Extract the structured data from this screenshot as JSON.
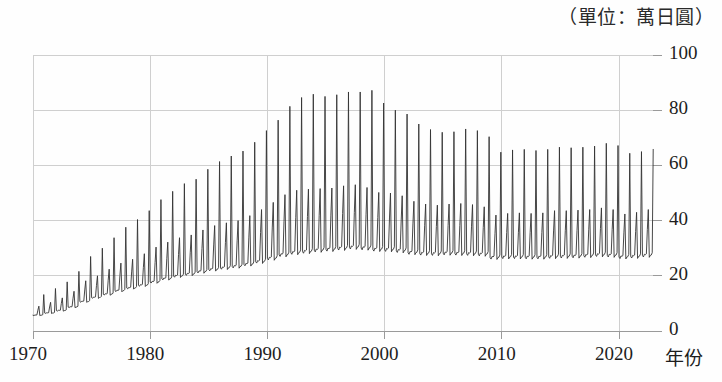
{
  "chart_data": {
    "type": "line",
    "title": "（單位：萬日圓）",
    "xlabel": "年份",
    "ylabel": "",
    "unit_caption": "（單位：萬日圓）",
    "xlim": [
      1970,
      2022.9
    ],
    "ylim": [
      0,
      100
    ],
    "grid": true,
    "legend": null,
    "xticks": [
      1970,
      1980,
      1990,
      2000,
      2010,
      2020
    ],
    "xtick_labels": [
      "1970",
      "1980",
      "1990",
      "2000",
      "2010",
      "2020"
    ],
    "yticks": [
      0,
      20,
      40,
      60,
      80,
      100
    ],
    "ytick_labels": [
      "0",
      "20",
      "40",
      "60",
      "80",
      "100"
    ],
    "y_axis_side": "right",
    "line_color": "#333333",
    "grid_color": "#cfcfcf",
    "axis_color": "#9a9a9a",
    "series_name": "每月現金給與總額",
    "frequency": "monthly",
    "annual_profile": [
      {
        "year": 1970,
        "base": 5.8,
        "summer": 9.0,
        "winter": 13.2
      },
      {
        "year": 1971,
        "base": 6.6,
        "summer": 10.4,
        "winter": 15.4
      },
      {
        "year": 1972,
        "base": 7.5,
        "summer": 12.0,
        "winter": 17.8
      },
      {
        "year": 1973,
        "base": 8.8,
        "summer": 14.4,
        "winter": 21.6
      },
      {
        "year": 1974,
        "base": 10.8,
        "summer": 18.2,
        "winter": 27.0
      },
      {
        "year": 1975,
        "base": 12.3,
        "summer": 20.0,
        "winter": 30.0
      },
      {
        "year": 1976,
        "base": 13.5,
        "summer": 22.4,
        "winter": 33.8
      },
      {
        "year": 1977,
        "base": 14.8,
        "summer": 24.6,
        "winter": 37.6
      },
      {
        "year": 1978,
        "base": 15.8,
        "summer": 26.0,
        "winter": 40.4
      },
      {
        "year": 1979,
        "base": 16.8,
        "summer": 28.0,
        "winter": 43.6
      },
      {
        "year": 1980,
        "base": 18.0,
        "summer": 30.4,
        "winter": 47.6
      },
      {
        "year": 1981,
        "base": 19.2,
        "summer": 32.2,
        "winter": 50.6
      },
      {
        "year": 1982,
        "base": 20.2,
        "summer": 33.8,
        "winter": 53.4
      },
      {
        "year": 1983,
        "base": 20.9,
        "summer": 34.8,
        "winter": 55.0
      },
      {
        "year": 1984,
        "base": 21.8,
        "summer": 36.6,
        "winter": 58.6
      },
      {
        "year": 1985,
        "base": 22.6,
        "summer": 38.2,
        "winter": 61.4
      },
      {
        "year": 1986,
        "base": 23.2,
        "summer": 39.2,
        "winter": 63.4
      },
      {
        "year": 1987,
        "base": 23.7,
        "summer": 40.0,
        "winter": 65.2
      },
      {
        "year": 1988,
        "base": 24.5,
        "summer": 41.8,
        "winter": 68.4
      },
      {
        "year": 1989,
        "base": 25.5,
        "summer": 44.0,
        "winter": 72.6
      },
      {
        "year": 1990,
        "base": 26.7,
        "summer": 46.6,
        "winter": 76.4
      },
      {
        "year": 1991,
        "base": 28.0,
        "summer": 49.4,
        "winter": 81.4
      },
      {
        "year": 1992,
        "base": 28.8,
        "summer": 51.0,
        "winter": 84.6
      },
      {
        "year": 1993,
        "base": 29.2,
        "summer": 51.4,
        "winter": 85.8
      },
      {
        "year": 1994,
        "base": 29.7,
        "summer": 51.6,
        "winter": 85.0
      },
      {
        "year": 1995,
        "base": 30.0,
        "summer": 51.8,
        "winter": 85.6
      },
      {
        "year": 1996,
        "base": 30.4,
        "summer": 52.6,
        "winter": 86.6
      },
      {
        "year": 1997,
        "base": 30.8,
        "summer": 53.0,
        "winter": 86.6
      },
      {
        "year": 1998,
        "base": 30.5,
        "summer": 52.0,
        "winter": 87.2
      },
      {
        "year": 1999,
        "base": 30.0,
        "summer": 50.2,
        "winter": 82.6
      },
      {
        "year": 2000,
        "base": 29.9,
        "summer": 50.0,
        "winter": 80.0
      },
      {
        "year": 2001,
        "base": 29.5,
        "summer": 49.0,
        "winter": 78.6
      },
      {
        "year": 2002,
        "base": 28.8,
        "summer": 47.0,
        "winter": 75.0
      },
      {
        "year": 2003,
        "base": 28.5,
        "summer": 46.0,
        "winter": 73.0
      },
      {
        "year": 2004,
        "base": 28.4,
        "summer": 45.6,
        "winter": 72.0
      },
      {
        "year": 2005,
        "base": 28.6,
        "summer": 46.0,
        "winter": 72.2
      },
      {
        "year": 2006,
        "base": 28.5,
        "summer": 46.2,
        "winter": 73.2
      },
      {
        "year": 2007,
        "base": 28.4,
        "summer": 45.8,
        "winter": 72.6
      },
      {
        "year": 2008,
        "base": 28.2,
        "summer": 45.0,
        "winter": 70.4
      },
      {
        "year": 2009,
        "base": 27.0,
        "summer": 42.0,
        "winter": 64.8
      },
      {
        "year": 2010,
        "base": 27.2,
        "summer": 42.6,
        "winter": 65.6
      },
      {
        "year": 2011,
        "base": 27.2,
        "summer": 42.8,
        "winter": 65.8
      },
      {
        "year": 2012,
        "base": 27.1,
        "summer": 42.6,
        "winter": 65.4
      },
      {
        "year": 2013,
        "base": 27.1,
        "summer": 42.8,
        "winter": 65.8
      },
      {
        "year": 2014,
        "base": 27.3,
        "summer": 43.6,
        "winter": 66.6
      },
      {
        "year": 2015,
        "base": 27.4,
        "summer": 43.6,
        "winter": 66.4
      },
      {
        "year": 2016,
        "base": 27.5,
        "summer": 43.8,
        "winter": 66.6
      },
      {
        "year": 2017,
        "base": 27.7,
        "summer": 44.0,
        "winter": 67.0
      },
      {
        "year": 2018,
        "base": 28.0,
        "summer": 44.6,
        "winter": 68.0
      },
      {
        "year": 2019,
        "base": 27.8,
        "summer": 44.0,
        "winter": 67.2
      },
      {
        "year": 2020,
        "base": 27.2,
        "summer": 42.4,
        "winter": 64.4
      },
      {
        "year": 2021,
        "base": 27.4,
        "summer": 43.0,
        "winter": 65.0
      },
      {
        "year": 2022,
        "base": 27.8,
        "summer": 44.0,
        "winter": 65.8
      }
    ]
  },
  "axes": {
    "unit_caption": "（單位：萬日圓）",
    "x_title": "年份",
    "x_labels": [
      "1970",
      "1980",
      "1990",
      "2000",
      "2010",
      "2020"
    ],
    "y_labels": [
      "0",
      "20",
      "40",
      "60",
      "80",
      "100"
    ]
  }
}
